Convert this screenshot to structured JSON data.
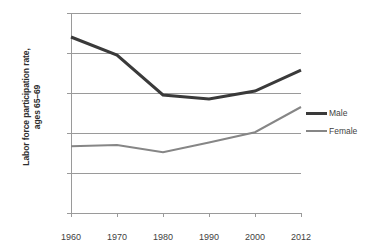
{
  "chart_data": {
    "type": "line",
    "title": "",
    "xlabel": "",
    "ylabel": "Labor force participation rate, ages 65–69",
    "ylabel_line1": "Labor force participation rate,",
    "ylabel_line2": "ages 65–69",
    "categories": [
      "1960",
      "1970",
      "1980",
      "1990",
      "2000",
      "2012"
    ],
    "x": [
      1960,
      1970,
      1980,
      1990,
      2000,
      2012
    ],
    "ylim": [
      0,
      50
    ],
    "ytick_labels": [
      "0%",
      "10%",
      "20%",
      "30%",
      "40%",
      "50%"
    ],
    "ytick_values": [
      0,
      10,
      20,
      30,
      40,
      50
    ],
    "grid": true,
    "legend_position": "right",
    "units": "percent",
    "series": [
      {
        "name": "Male",
        "color": "#3a3a3a",
        "line_width": 3,
        "values": [
          44.0,
          39.5,
          29.5,
          28.5,
          30.5,
          35.7
        ]
      },
      {
        "name": "Female",
        "color": "#868686",
        "line_width": 2,
        "values": [
          16.7,
          17.0,
          15.2,
          17.6,
          20.2,
          26.5
        ]
      }
    ]
  },
  "legend": {
    "items": [
      {
        "label": "Male"
      },
      {
        "label": "Female"
      }
    ]
  }
}
